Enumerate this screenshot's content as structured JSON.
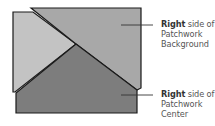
{
  "diagram": {
    "colors": {
      "light_piece": "#c3c3c3",
      "medium_piece": "#a8a8a8",
      "dark_piece": "#7d7d7d",
      "outline": "#1a1a1a",
      "leader": "#333333"
    },
    "labels": [
      {
        "bold": "Right",
        "rest_line1": " side of",
        "line2": "Patchwork",
        "line3": "Background"
      },
      {
        "bold": "Right",
        "rest_line1": " side of",
        "line2": "Patchwork",
        "line3": "Center"
      }
    ]
  }
}
